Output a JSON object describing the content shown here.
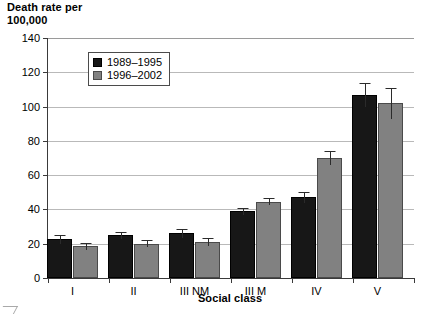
{
  "chart_data": {
    "type": "bar",
    "title": "",
    "ylabel": "Death rate per\n100,000",
    "xlabel": "Social class",
    "categories": [
      "I",
      "II",
      "III NM",
      "III M",
      "IV",
      "V"
    ],
    "ylim": [
      0,
      140
    ],
    "yticks": [
      0,
      20,
      40,
      60,
      80,
      100,
      120,
      140
    ],
    "ytick_labels": [
      "0",
      "20",
      "40",
      "60",
      "80",
      "100",
      "120",
      "140"
    ],
    "grid": true,
    "legend_position": "upper left inside",
    "series": [
      {
        "name": "1989–1995",
        "color": "#171717",
        "values": [
          22.5,
          25.0,
          26.0,
          39.0,
          47.0,
          107.0
        ],
        "err_low": [
          2.5,
          2.0,
          2.5,
          2.0,
          3.0,
          7.0
        ],
        "err_high": [
          2.5,
          2.0,
          2.5,
          2.0,
          3.0,
          7.0
        ]
      },
      {
        "name": "1996–2002",
        "color": "#818181",
        "values": [
          18.5,
          20.0,
          21.0,
          44.5,
          70.0,
          102.0
        ],
        "err_low": [
          2.0,
          2.0,
          2.5,
          2.0,
          4.0,
          9.0
        ],
        "err_high": [
          2.0,
          2.0,
          2.5,
          2.0,
          4.0,
          9.0
        ]
      }
    ]
  },
  "legend": {
    "entries": [
      {
        "label": "1989–1995",
        "swatch": "black-swatch"
      },
      {
        "label": "1996–2002",
        "swatch": "gray-swatch"
      }
    ]
  }
}
